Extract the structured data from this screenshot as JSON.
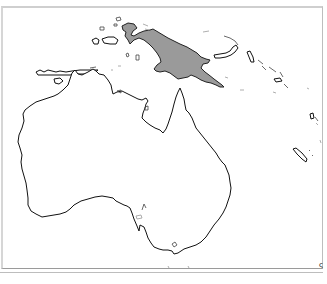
{
  "map": {
    "title": "",
    "regions": [
      {
        "name": "Australia",
        "highlighted": false
      },
      {
        "name": "New Guinea",
        "highlighted": true
      },
      {
        "name": "Timor",
        "highlighted": false
      },
      {
        "name": "Lesser Sunda Islands",
        "highlighted": false
      },
      {
        "name": "Maluku Islands",
        "highlighted": false
      },
      {
        "name": "New Britain",
        "highlighted": false
      },
      {
        "name": "Solomon Islands",
        "highlighted": false
      },
      {
        "name": "Vanuatu",
        "highlighted": false
      },
      {
        "name": "New Caledonia",
        "highlighted": false
      },
      {
        "name": "Tasmania (partially cut off)",
        "highlighted": false
      }
    ],
    "colors": {
      "highlight_fill": "#9a9a9a",
      "land_fill": "#ffffff",
      "coastline": "#111111",
      "frame_border": "#bdbdbd",
      "background": "#ffffff"
    },
    "corner_mark": "ς"
  }
}
